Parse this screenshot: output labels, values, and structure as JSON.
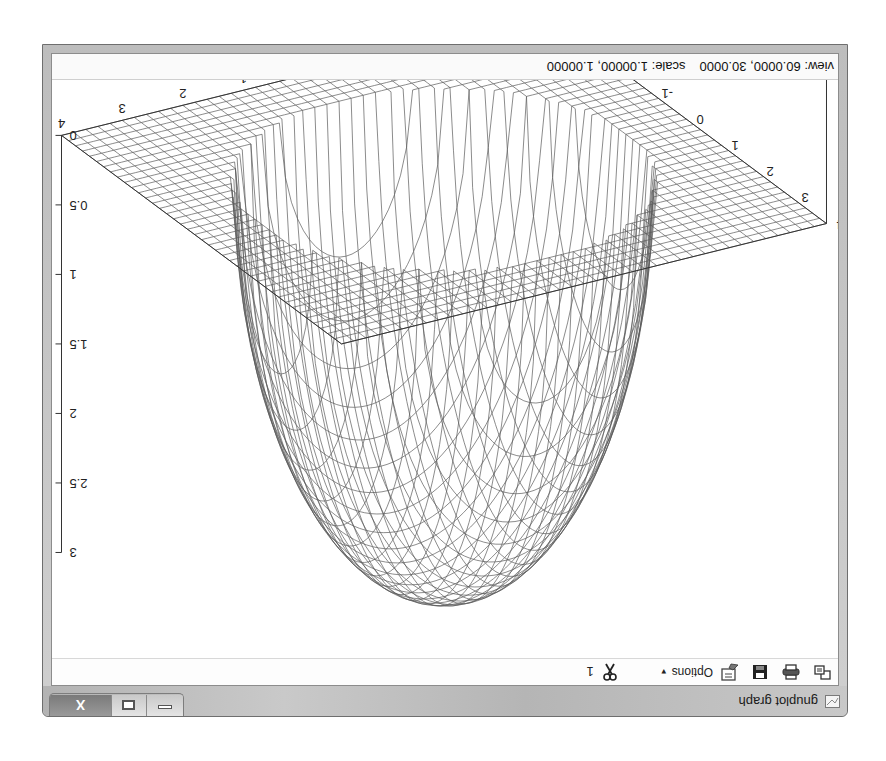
{
  "window": {
    "title": "gnuplot graph",
    "app_icon": "gnuplot-graph-icon",
    "controls": {
      "minimize": "minimize-icon",
      "maximize": "maximize-icon",
      "close_label": "X"
    },
    "orientation_note": "screenshot is rotated 180 degrees"
  },
  "toolbar": {
    "items": [
      {
        "icon": "copy-icon"
      },
      {
        "icon": "print-icon"
      },
      {
        "icon": "save-icon"
      },
      {
        "icon": "options-icon",
        "label": "Options",
        "caret": "▼"
      },
      {
        "icon": "scissors-icon"
      }
    ],
    "plot_number": "1"
  },
  "statusbar": {
    "view_label": "view:",
    "view_value": "60.0000, 30.0000",
    "scale_label": "scale:",
    "scale_value": "1.00000, 1.00000"
  },
  "chart_data": {
    "type": "surface3d",
    "title": "",
    "style": "wireframe mesh (hidden3d)",
    "view": {
      "rot_x": 60,
      "rot_z": 30,
      "scale": 1.0,
      "scale_z": 1.0
    },
    "x_ticks": [
      "-4",
      "-3",
      "-2",
      "-1",
      "0",
      "1",
      "2",
      "3",
      "4"
    ],
    "y_ticks": [
      "-4",
      "-3",
      "-2",
      "-1",
      "0",
      "1",
      "2",
      "3",
      "4"
    ],
    "z_ticks": [
      "0",
      "0.5",
      "1",
      "1.5",
      "2",
      "2.5",
      "3"
    ],
    "xrange": [
      -4,
      4
    ],
    "yrange": [
      -4,
      4
    ],
    "zrange": [
      0,
      3
    ],
    "function_hint": "z = -sqrt(9 - x^2 - y^2) for x^2+y^2<9, else 0 (appears as depth up to 3)"
  }
}
